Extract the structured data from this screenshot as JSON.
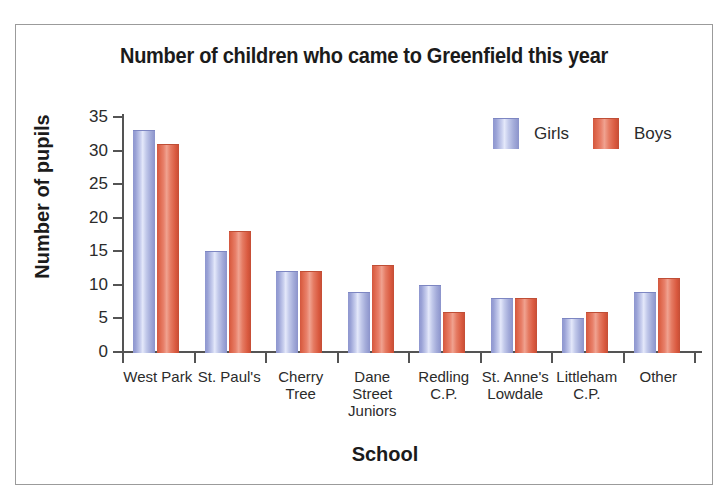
{
  "chart_data": {
    "type": "bar",
    "title": "Number of children who came to Greenfield this year",
    "xlabel": "School",
    "ylabel": "Number of pupils",
    "categories": [
      "West Park",
      "St. Paul's",
      "Cherry Tree",
      "Dane Street Juniors",
      "Redling C.P.",
      "St. Anne's Lowdale",
      "Littleham C.P.",
      "Other"
    ],
    "category_lines": [
      [
        "West Park"
      ],
      [
        "St. Paul's"
      ],
      [
        "Cherry",
        "Tree"
      ],
      [
        "Dane",
        "Street",
        "Juniors"
      ],
      [
        "Redling",
        "C.P."
      ],
      [
        "St. Anne's",
        "Lowdale"
      ],
      [
        "Littleham",
        "C.P."
      ],
      [
        "Other"
      ]
    ],
    "series": [
      {
        "name": "Girls",
        "color": "#aab2e0",
        "values": [
          33,
          15,
          12,
          9,
          10,
          8,
          5,
          9
        ]
      },
      {
        "name": "Boys",
        "color": "#e06a4f",
        "values": [
          31,
          18,
          12,
          13,
          6,
          8,
          6,
          11
        ]
      }
    ],
    "ylim": [
      0,
      35
    ],
    "yticks": [
      0,
      5,
      10,
      15,
      20,
      25,
      30,
      35
    ],
    "ytick_labels": [
      "0",
      "5",
      "10",
      "15",
      "20",
      "25",
      "30",
      "35"
    ],
    "grid": false,
    "legend_position": "top-right"
  },
  "legend": {
    "items": [
      {
        "label": "Girls",
        "swatch": "girls-swatch"
      },
      {
        "label": "Boys",
        "swatch": "boys-swatch"
      }
    ]
  }
}
